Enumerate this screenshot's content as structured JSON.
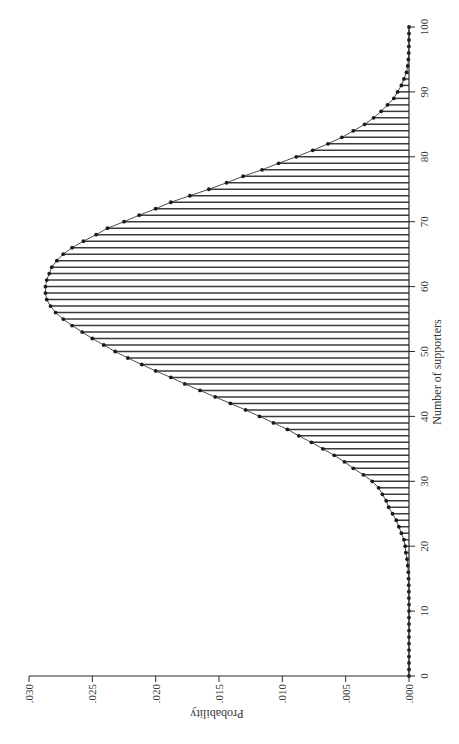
{
  "chart_data": {
    "type": "bar",
    "orientation": "rotated-90-ccw",
    "title": "",
    "xlabel": "Number of supporters",
    "ylabel": "Probability",
    "xlim": [
      0,
      100
    ],
    "ylim": [
      0,
      0.03
    ],
    "grid": false,
    "legend": "none",
    "x_ticks": [
      0,
      10,
      20,
      30,
      40,
      50,
      60,
      70,
      80,
      90,
      100
    ],
    "x_tick_labels": [
      "0",
      "10",
      "20",
      "30",
      "40",
      "50",
      "60",
      "70",
      "80",
      "90",
      "100"
    ],
    "y_ticks": [
      0,
      0.005,
      0.01,
      0.015,
      0.02,
      0.025,
      0.03
    ],
    "y_tick_labels": [
      ".000",
      ".005",
      ".010",
      ".015",
      ".020",
      ".025",
      ".030"
    ],
    "x": [
      0,
      1,
      2,
      3,
      4,
      5,
      6,
      7,
      8,
      9,
      10,
      11,
      12,
      13,
      14,
      15,
      16,
      17,
      18,
      19,
      20,
      21,
      22,
      23,
      24,
      25,
      26,
      27,
      28,
      29,
      30,
      31,
      32,
      33,
      34,
      35,
      36,
      37,
      38,
      39,
      40,
      41,
      42,
      43,
      44,
      45,
      46,
      47,
      48,
      49,
      50,
      51,
      52,
      53,
      54,
      55,
      56,
      57,
      58,
      59,
      60,
      61,
      62,
      63,
      64,
      65,
      66,
      67,
      68,
      69,
      70,
      71,
      72,
      73,
      74,
      75,
      76,
      77,
      78,
      79,
      80,
      81,
      82,
      83,
      84,
      85,
      86,
      87,
      88,
      89,
      90,
      91,
      92,
      93,
      94,
      95,
      96,
      97,
      98,
      99,
      100
    ],
    "values": [
      0,
      0,
      0,
      0,
      0,
      0,
      0,
      0,
      0,
      0,
      0,
      0,
      1e-05,
      1e-05,
      2e-05,
      3e-05,
      5e-05,
      0.0001,
      0.00015,
      0.00025,
      0.0003,
      0.0004,
      0.0006,
      0.0008,
      0.001,
      0.0013,
      0.0016,
      0.0018,
      0.0021,
      0.0024,
      0.0029,
      0.0036,
      0.0044,
      0.0051,
      0.0059,
      0.0068,
      0.0077,
      0.0087,
      0.0096,
      0.0107,
      0.0118,
      0.0129,
      0.0141,
      0.0153,
      0.0165,
      0.0177,
      0.0188,
      0.02,
      0.0211,
      0.0222,
      0.0232,
      0.0241,
      0.025,
      0.0258,
      0.0266,
      0.0273,
      0.0279,
      0.0283,
      0.0286,
      0.0287,
      0.0287,
      0.0286,
      0.0284,
      0.0282,
      0.0278,
      0.0273,
      0.0266,
      0.0257,
      0.0247,
      0.0238,
      0.0225,
      0.0213,
      0.02,
      0.0188,
      0.0173,
      0.0158,
      0.0144,
      0.0131,
      0.0116,
      0.0103,
      0.0089,
      0.0076,
      0.0064,
      0.0053,
      0.0044,
      0.0035,
      0.0028,
      0.0022,
      0.0017,
      0.0012,
      0.0009,
      0.0006,
      0.0004,
      0.0002,
      0.0001,
      5e-05,
      2e-05,
      1e-05,
      0,
      0,
      0
    ]
  }
}
